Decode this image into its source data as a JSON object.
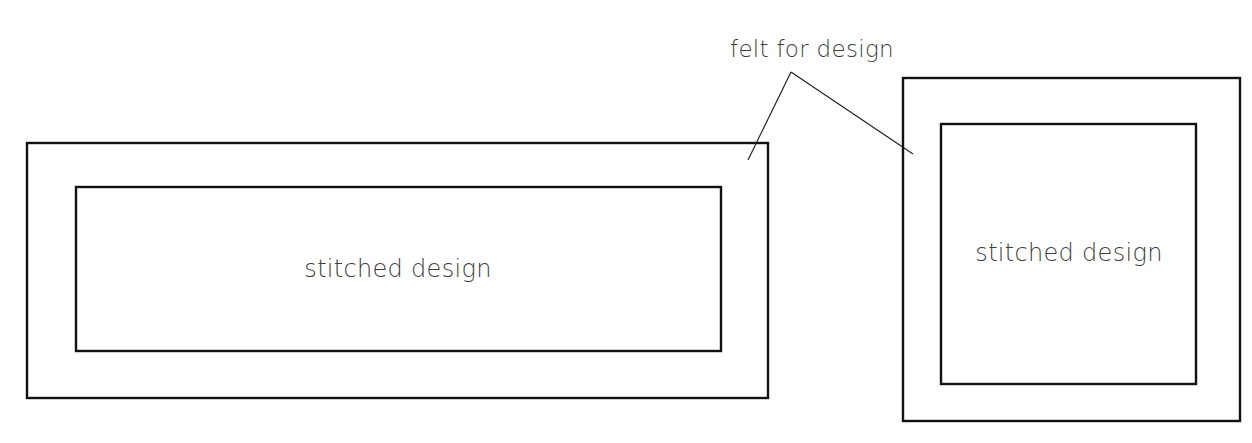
{
  "diagram": {
    "callout_label": "felt for design",
    "panels": [
      {
        "name": "rectangular-panel",
        "outer_label": "felt for design",
        "inner_label": "stitched design",
        "outer": {
          "x": 27,
          "y": 143,
          "w": 741,
          "h": 255
        },
        "inner": {
          "x": 76,
          "y": 187,
          "w": 645,
          "h": 164
        }
      },
      {
        "name": "square-panel",
        "outer_label": "felt for design",
        "inner_label": "stitched design",
        "outer": {
          "x": 903,
          "y": 78,
          "w": 337,
          "h": 343
        },
        "inner": {
          "x": 941,
          "y": 124,
          "w": 255,
          "h": 260
        }
      }
    ],
    "leader_lines": {
      "apex": {
        "x": 791,
        "y": 72
      },
      "targets": [
        {
          "x": 748,
          "y": 160
        },
        {
          "x": 913,
          "y": 154
        }
      ]
    },
    "colors": {
      "stroke": "#111111",
      "text": "#3d3d3d",
      "background": "#ffffff"
    }
  }
}
